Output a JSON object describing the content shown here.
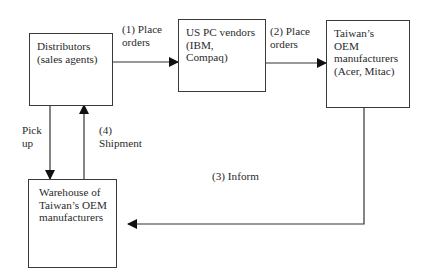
{
  "diagram": {
    "type": "flowchart",
    "nodes": [
      {
        "id": "distributors",
        "label": "Distributors\n(sales agents)"
      },
      {
        "id": "us_pc_vendors",
        "label": "US PC vendors\n(IBM,\nCompaq)"
      },
      {
        "id": "taiwan_oem",
        "label": "Taiwan’s\nOEM\nmanufacturers\n(Acer, Mitac)"
      },
      {
        "id": "warehouse",
        "label": "Warehouse of\nTaiwan’s OEM\nmanufacturers"
      }
    ],
    "edges": [
      {
        "from": "distributors",
        "to": "us_pc_vendors",
        "label": "(1) Place\norders"
      },
      {
        "from": "us_pc_vendors",
        "to": "taiwan_oem",
        "label": "(2) Place\norders"
      },
      {
        "from": "taiwan_oem",
        "to": "warehouse",
        "label": "(3) Inform"
      },
      {
        "from": "warehouse",
        "to": "distributors",
        "label": "(4)\nShipment"
      },
      {
        "from": "distributors",
        "to": "warehouse",
        "label": "Pick\nup"
      }
    ]
  }
}
